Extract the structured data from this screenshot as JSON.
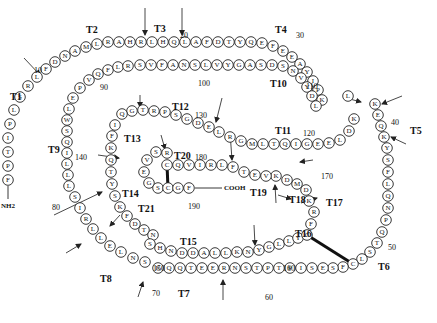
{
  "diagram": {
    "type": "protein-sequence-map",
    "termini": {
      "n": "NH2",
      "c": "COOH"
    },
    "chain": [
      {
        "aa": "F",
        "x": 8,
        "y": 180
      },
      {
        "aa": "P",
        "x": 8,
        "y": 166
      },
      {
        "aa": "T",
        "x": 8,
        "y": 152
      },
      {
        "aa": "I",
        "x": 8,
        "y": 138
      },
      {
        "aa": "P",
        "x": 10,
        "y": 124
      },
      {
        "aa": "L",
        "x": 14,
        "y": 110
      },
      {
        "aa": "S",
        "x": 20,
        "y": 97
      },
      {
        "aa": "R",
        "x": 28,
        "y": 86
      },
      {
        "aa": "L",
        "x": 37,
        "y": 77
      },
      {
        "aa": "F",
        "x": 46,
        "y": 69
      },
      {
        "aa": "D",
        "x": 55,
        "y": 62
      },
      {
        "aa": "N",
        "x": 65,
        "y": 56
      },
      {
        "aa": "A",
        "x": 75,
        "y": 51
      },
      {
        "aa": "M",
        "x": 86,
        "y": 47
      },
      {
        "aa": "L",
        "x": 97,
        "y": 44
      },
      {
        "aa": "R",
        "x": 108,
        "y": 42
      },
      {
        "aa": "A",
        "x": 119,
        "y": 42
      },
      {
        "aa": "H",
        "x": 130,
        "y": 42
      },
      {
        "aa": "R",
        "x": 141,
        "y": 42
      },
      {
        "aa": "L",
        "x": 152,
        "y": 42
      },
      {
        "aa": "H",
        "x": 163,
        "y": 42
      },
      {
        "aa": "Q",
        "x": 174,
        "y": 42
      },
      {
        "aa": "L",
        "x": 185,
        "y": 42
      },
      {
        "aa": "A",
        "x": 196,
        "y": 42
      },
      {
        "aa": "F",
        "x": 207,
        "y": 42
      },
      {
        "aa": "D",
        "x": 218,
        "y": 42
      },
      {
        "aa": "T",
        "x": 229,
        "y": 42
      },
      {
        "aa": "Y",
        "x": 240,
        "y": 42
      },
      {
        "aa": "Q",
        "x": 251,
        "y": 42
      },
      {
        "aa": "E",
        "x": 262,
        "y": 43
      },
      {
        "aa": "F",
        "x": 273,
        "y": 46
      },
      {
        "aa": "E",
        "x": 283,
        "y": 51
      },
      {
        "aa": "E",
        "x": 292,
        "y": 57
      },
      {
        "aa": "A",
        "x": 300,
        "y": 64
      },
      {
        "aa": "Y",
        "x": 307,
        "y": 72
      },
      {
        "aa": "I",
        "x": 313,
        "y": 81
      },
      {
        "aa": "P",
        "x": 318,
        "y": 90
      },
      {
        "aa": "K",
        "x": 322,
        "y": 100
      },
      {
        "aa": "K",
        "x": 375,
        "y": 104
      },
      {
        "aa": "E",
        "x": 378,
        "y": 115
      },
      {
        "aa": "Q",
        "x": 381,
        "y": 126
      },
      {
        "aa": "K",
        "x": 384,
        "y": 137
      },
      {
        "aa": "Y",
        "x": 387,
        "y": 148
      },
      {
        "aa": "S",
        "x": 388,
        "y": 160
      },
      {
        "aa": "F",
        "x": 388,
        "y": 172
      },
      {
        "aa": "L",
        "x": 388,
        "y": 184
      },
      {
        "aa": "Q",
        "x": 388,
        "y": 196
      },
      {
        "aa": "N",
        "x": 388,
        "y": 208
      },
      {
        "aa": "P",
        "x": 386,
        "y": 220
      },
      {
        "aa": "Q",
        "x": 382,
        "y": 232
      },
      {
        "aa": "T",
        "x": 377,
        "y": 243
      },
      {
        "aa": "S",
        "x": 370,
        "y": 252
      },
      {
        "aa": "L",
        "x": 362,
        "y": 259
      },
      {
        "aa": "C",
        "x": 353,
        "y": 264
      },
      {
        "aa": "F",
        "x": 343,
        "y": 267
      },
      {
        "aa": "S",
        "x": 333,
        "y": 268
      },
      {
        "aa": "E",
        "x": 323,
        "y": 268
      },
      {
        "aa": "S",
        "x": 312,
        "y": 268
      },
      {
        "aa": "I",
        "x": 301,
        "y": 268
      },
      {
        "aa": "P",
        "x": 290,
        "y": 268
      },
      {
        "aa": "T",
        "x": 279,
        "y": 268
      },
      {
        "aa": "P",
        "x": 268,
        "y": 268
      },
      {
        "aa": "T",
        "x": 257,
        "y": 268
      },
      {
        "aa": "S",
        "x": 246,
        "y": 268
      },
      {
        "aa": "N",
        "x": 235,
        "y": 268
      },
      {
        "aa": "R",
        "x": 224,
        "y": 268
      },
      {
        "aa": "E",
        "x": 213,
        "y": 268
      },
      {
        "aa": "E",
        "x": 202,
        "y": 268
      },
      {
        "aa": "T",
        "x": 191,
        "y": 268
      },
      {
        "aa": "Q",
        "x": 180,
        "y": 268
      },
      {
        "aa": "Q",
        "x": 169,
        "y": 268
      },
      {
        "aa": "K",
        "x": 158,
        "y": 268
      },
      {
        "aa": "S",
        "x": 145,
        "y": 262
      },
      {
        "aa": "N",
        "x": 133,
        "y": 258
      },
      {
        "aa": "L",
        "x": 121,
        "y": 252
      },
      {
        "aa": "E",
        "x": 110,
        "y": 246
      },
      {
        "aa": "L",
        "x": 101,
        "y": 238
      },
      {
        "aa": "L",
        "x": 93,
        "y": 229
      },
      {
        "aa": "R",
        "x": 86,
        "y": 219
      },
      {
        "aa": "I",
        "x": 80,
        "y": 208
      },
      {
        "aa": "S",
        "x": 75,
        "y": 197
      },
      {
        "aa": "L",
        "x": 69,
        "y": 186
      },
      {
        "aa": "L",
        "x": 68,
        "y": 175
      },
      {
        "aa": "L",
        "x": 67,
        "y": 164
      },
      {
        "aa": "I",
        "x": 67,
        "y": 153
      },
      {
        "aa": "Q",
        "x": 67,
        "y": 142
      },
      {
        "aa": "S",
        "x": 67,
        "y": 131
      },
      {
        "aa": "W",
        "x": 67,
        "y": 120
      },
      {
        "aa": "L",
        "x": 69,
        "y": 109
      },
      {
        "aa": "E",
        "x": 73,
        "y": 98
      },
      {
        "aa": "P",
        "x": 80,
        "y": 88
      },
      {
        "aa": "V",
        "x": 89,
        "y": 80
      },
      {
        "aa": "Q",
        "x": 98,
        "y": 74
      },
      {
        "aa": "F",
        "x": 108,
        "y": 70
      },
      {
        "aa": "L",
        "x": 118,
        "y": 67
      },
      {
        "aa": "R",
        "x": 128,
        "y": 66
      },
      {
        "aa": "S",
        "x": 140,
        "y": 65
      },
      {
        "aa": "V",
        "x": 151,
        "y": 65
      },
      {
        "aa": "F",
        "x": 162,
        "y": 65
      },
      {
        "aa": "A",
        "x": 173,
        "y": 65
      },
      {
        "aa": "N",
        "x": 184,
        "y": 65
      },
      {
        "aa": "S",
        "x": 195,
        "y": 65
      },
      {
        "aa": "L",
        "x": 206,
        "y": 65
      },
      {
        "aa": "V",
        "x": 217,
        "y": 65
      },
      {
        "aa": "Y",
        "x": 228,
        "y": 65
      },
      {
        "aa": "G",
        "x": 239,
        "y": 65
      },
      {
        "aa": "A",
        "x": 250,
        "y": 65
      },
      {
        "aa": "S",
        "x": 261,
        "y": 65
      },
      {
        "aa": "D",
        "x": 272,
        "y": 65
      },
      {
        "aa": "S",
        "x": 283,
        "y": 66
      },
      {
        "aa": "N",
        "x": 293,
        "y": 71
      },
      {
        "aa": "V",
        "x": 301,
        "y": 78
      },
      {
        "aa": "Y",
        "x": 307,
        "y": 87
      },
      {
        "aa": "D",
        "x": 312,
        "y": 96
      },
      {
        "aa": "L",
        "x": 316,
        "y": 106
      },
      {
        "aa": "L",
        "x": 348,
        "y": 96
      },
      {
        "aa": "K",
        "x": 354,
        "y": 119
      },
      {
        "aa": "D",
        "x": 349,
        "y": 131
      },
      {
        "aa": "L",
        "x": 340,
        "y": 140
      },
      {
        "aa": "E",
        "x": 329,
        "y": 143
      },
      {
        "aa": "E",
        "x": 318,
        "y": 144
      },
      {
        "aa": "G",
        "x": 307,
        "y": 144
      },
      {
        "aa": "I",
        "x": 296,
        "y": 144
      },
      {
        "aa": "Q",
        "x": 285,
        "y": 144
      },
      {
        "aa": "T",
        "x": 274,
        "y": 144
      },
      {
        "aa": "L",
        "x": 263,
        "y": 144
      },
      {
        "aa": "M",
        "x": 252,
        "y": 144
      },
      {
        "aa": "G",
        "x": 241,
        "y": 141
      },
      {
        "aa": "R",
        "x": 230,
        "y": 137
      },
      {
        "aa": "L",
        "x": 219,
        "y": 132
      },
      {
        "aa": "E",
        "x": 209,
        "y": 127
      },
      {
        "aa": "D",
        "x": 198,
        "y": 123
      },
      {
        "aa": "G",
        "x": 187,
        "y": 119
      },
      {
        "aa": "S",
        "x": 176,
        "y": 115
      },
      {
        "aa": "P",
        "x": 165,
        "y": 112
      },
      {
        "aa": "R",
        "x": 154,
        "y": 111
      },
      {
        "aa": "T",
        "x": 143,
        "y": 110
      },
      {
        "aa": "G",
        "x": 132,
        "y": 111
      },
      {
        "aa": "Q",
        "x": 122,
        "y": 114
      },
      {
        "aa": "I",
        "x": 115,
        "y": 125
      },
      {
        "aa": "F",
        "x": 112,
        "y": 136
      },
      {
        "aa": "K",
        "x": 111,
        "y": 148
      },
      {
        "aa": "Q",
        "x": 111,
        "y": 160
      },
      {
        "aa": "T",
        "x": 111,
        "y": 172
      },
      {
        "aa": "Y",
        "x": 112,
        "y": 184
      },
      {
        "aa": "S",
        "x": 115,
        "y": 196
      },
      {
        "aa": "K",
        "x": 120,
        "y": 207
      },
      {
        "aa": "F",
        "x": 127,
        "y": 216
      },
      {
        "aa": "D",
        "x": 135,
        "y": 224
      },
      {
        "aa": "T",
        "x": 144,
        "y": 230
      },
      {
        "aa": "N",
        "x": 153,
        "y": 235
      },
      {
        "aa": "S",
        "x": 150,
        "y": 244
      },
      {
        "aa": "H",
        "x": 160,
        "y": 248
      },
      {
        "aa": "N",
        "x": 171,
        "y": 251
      },
      {
        "aa": "D",
        "x": 182,
        "y": 253
      },
      {
        "aa": "D",
        "x": 193,
        "y": 253
      },
      {
        "aa": "A",
        "x": 204,
        "y": 253
      },
      {
        "aa": "L",
        "x": 215,
        "y": 253
      },
      {
        "aa": "L",
        "x": 226,
        "y": 253
      },
      {
        "aa": "K",
        "x": 237,
        "y": 252
      },
      {
        "aa": "N",
        "x": 248,
        "y": 252
      },
      {
        "aa": "Y",
        "x": 259,
        "y": 250
      },
      {
        "aa": "G",
        "x": 269,
        "y": 247
      },
      {
        "aa": "L",
        "x": 279,
        "y": 244
      },
      {
        "aa": "L",
        "x": 289,
        "y": 241
      },
      {
        "aa": "Y",
        "x": 298,
        "y": 238
      },
      {
        "aa": "C",
        "x": 307,
        "y": 235
      },
      {
        "aa": "F",
        "x": 311,
        "y": 224
      },
      {
        "aa": "R",
        "x": 314,
        "y": 212
      },
      {
        "aa": "K",
        "x": 309,
        "y": 201
      },
      {
        "aa": "D",
        "x": 306,
        "y": 190
      },
      {
        "aa": "M",
        "x": 297,
        "y": 184
      },
      {
        "aa": "D",
        "x": 287,
        "y": 180
      },
      {
        "aa": "K",
        "x": 276,
        "y": 176
      },
      {
        "aa": "V",
        "x": 266,
        "y": 176
      },
      {
        "aa": "E",
        "x": 255,
        "y": 175
      },
      {
        "aa": "T",
        "x": 244,
        "y": 172
      },
      {
        "aa": "F",
        "x": 233,
        "y": 167
      },
      {
        "aa": "L",
        "x": 222,
        "y": 165
      },
      {
        "aa": "R",
        "x": 211,
        "y": 165
      },
      {
        "aa": "I",
        "x": 200,
        "y": 165
      },
      {
        "aa": "V",
        "x": 189,
        "y": 165
      },
      {
        "aa": "Q",
        "x": 178,
        "y": 165
      },
      {
        "aa": "C",
        "x": 167,
        "y": 165
      },
      {
        "aa": "R",
        "x": 167,
        "y": 153
      },
      {
        "aa": "S",
        "x": 156,
        "y": 152
      },
      {
        "aa": "V",
        "x": 147,
        "y": 160
      },
      {
        "aa": "E",
        "x": 144,
        "y": 172
      },
      {
        "aa": "G",
        "x": 149,
        "y": 183
      },
      {
        "aa": "S",
        "x": 158,
        "y": 188
      },
      {
        "aa": "C",
        "x": 168,
        "y": 188
      },
      {
        "aa": "G",
        "x": 178,
        "y": 188
      },
      {
        "aa": "F",
        "x": 189,
        "y": 188
      }
    ],
    "fragment_labels": [
      {
        "t": "T1",
        "x": 10,
        "y": 100
      },
      {
        "t": "T2",
        "x": 86,
        "y": 33
      },
      {
        "t": "T3",
        "x": 154,
        "y": 32
      },
      {
        "t": "T4",
        "x": 275,
        "y": 33
      },
      {
        "t": "T5",
        "x": 410,
        "y": 134
      },
      {
        "t": "T6",
        "x": 378,
        "y": 270
      },
      {
        "t": "T7",
        "x": 178,
        "y": 297
      },
      {
        "t": "T8",
        "x": 100,
        "y": 282
      },
      {
        "t": "T9",
        "x": 48,
        "y": 153
      },
      {
        "t": "T10",
        "x": 270,
        "y": 87
      },
      {
        "t": "T11",
        "x": 275,
        "y": 134
      },
      {
        "t": "T12",
        "x": 172,
        "y": 110
      },
      {
        "t": "T13",
        "x": 124,
        "y": 142
      },
      {
        "t": "T14",
        "x": 122,
        "y": 197
      },
      {
        "t": "T15",
        "x": 180,
        "y": 245
      },
      {
        "t": "T16",
        "x": 295,
        "y": 237
      },
      {
        "t": "T17",
        "x": 326,
        "y": 206
      },
      {
        "t": "T18",
        "x": 289,
        "y": 203
      },
      {
        "t": "T19",
        "x": 250,
        "y": 196
      },
      {
        "t": "T20",
        "x": 174,
        "y": 159
      },
      {
        "t": "T21",
        "x": 138,
        "y": 212
      }
    ],
    "position_numbers": [
      {
        "n": "10",
        "x": 34,
        "y": 73
      },
      {
        "n": "20",
        "x": 180,
        "y": 38
      },
      {
        "n": "30",
        "x": 296,
        "y": 38
      },
      {
        "n": "40",
        "x": 391,
        "y": 125
      },
      {
        "n": "50",
        "x": 388,
        "y": 250
      },
      {
        "n": "60",
        "x": 265,
        "y": 300
      },
      {
        "n": "70",
        "x": 152,
        "y": 296
      },
      {
        "n": "80",
        "x": 52,
        "y": 210
      },
      {
        "n": "90",
        "x": 100,
        "y": 90
      },
      {
        "n": "100",
        "x": 198,
        "y": 86
      },
      {
        "n": "110",
        "x": 306,
        "y": 89
      },
      {
        "n": "120",
        "x": 303,
        "y": 136
      },
      {
        "n": "130",
        "x": 195,
        "y": 118
      },
      {
        "n": "140",
        "x": 75,
        "y": 160
      },
      {
        "n": "150",
        "x": 153,
        "y": 271
      },
      {
        "n": "160",
        "x": 283,
        "y": 271
      },
      {
        "n": "170",
        "x": 321,
        "y": 179
      },
      {
        "n": "180",
        "x": 195,
        "y": 160
      },
      {
        "n": "190",
        "x": 188,
        "y": 209
      }
    ],
    "cleavage_arrows": [
      {
        "x1": 24,
        "y1": 58,
        "x2": 40,
        "y2": 75
      },
      {
        "x1": 145,
        "y1": 8,
        "x2": 145,
        "y2": 35
      },
      {
        "x1": 182,
        "y1": 8,
        "x2": 182,
        "y2": 35
      },
      {
        "x1": 402,
        "y1": 96,
        "x2": 382,
        "y2": 104
      },
      {
        "x1": 406,
        "y1": 144,
        "x2": 391,
        "y2": 137
      },
      {
        "x1": 346,
        "y1": 98,
        "x2": 361,
        "y2": 102
      },
      {
        "x1": 313,
        "y1": 160,
        "x2": 300,
        "y2": 162
      },
      {
        "x1": 140,
        "y1": 95,
        "x2": 140,
        "y2": 107
      },
      {
        "x1": 222,
        "y1": 98,
        "x2": 216,
        "y2": 122
      },
      {
        "x1": 230,
        "y1": 132,
        "x2": 232,
        "y2": 160
      },
      {
        "x1": 161,
        "y1": 135,
        "x2": 165,
        "y2": 149
      },
      {
        "x1": 98,
        "y1": 155,
        "x2": 119,
        "y2": 158
      },
      {
        "x1": 120,
        "y1": 215,
        "x2": 110,
        "y2": 226
      },
      {
        "x1": 54,
        "y1": 215,
        "x2": 102,
        "y2": 192
      },
      {
        "x1": 66,
        "y1": 253,
        "x2": 81,
        "y2": 244
      },
      {
        "x1": 254,
        "y1": 225,
        "x2": 255,
        "y2": 245
      },
      {
        "x1": 276,
        "y1": 203,
        "x2": 275,
        "y2": 185
      },
      {
        "x1": 301,
        "y1": 203,
        "x2": 317,
        "y2": 198
      },
      {
        "x1": 278,
        "y1": 195,
        "x2": 291,
        "y2": 199
      },
      {
        "x1": 138,
        "y1": 297,
        "x2": 143,
        "y2": 282
      },
      {
        "x1": 223,
        "y1": 300,
        "x2": 223,
        "y2": 280
      }
    ],
    "disulfide_bonds": [
      {
        "x1": 307,
        "y1": 235,
        "x2": 353,
        "y2": 264
      },
      {
        "x1": 167,
        "y1": 165,
        "x2": 168,
        "y2": 188
      }
    ]
  }
}
